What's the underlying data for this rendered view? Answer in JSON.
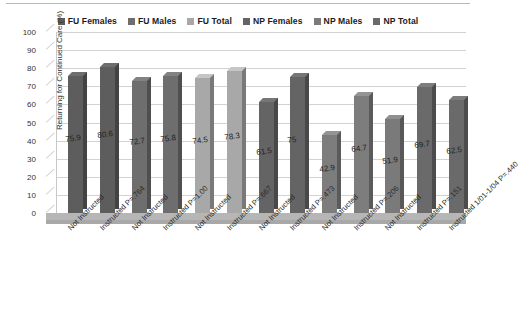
{
  "chart_data": {
    "type": "bar",
    "title": "",
    "xlabel": "",
    "ylabel": "Returning for Continued Care (%)",
    "ylim": [
      0,
      100
    ],
    "ytick_step": 10,
    "ytick_labels": [
      "100",
      "90",
      "80",
      "70",
      "60",
      "50",
      "40",
      "30",
      "20",
      "10",
      "0"
    ],
    "grid": true,
    "legend_position": "top-center",
    "three_d": true,
    "legend": [
      {
        "label": "FU Females",
        "color": "#5d5d5d"
      },
      {
        "label": "FU Males",
        "color": "#6e6e6e"
      },
      {
        "label": "FU Total",
        "color": "#a8a8a8"
      },
      {
        "label": "NP Females",
        "color": "#646464"
      },
      {
        "label": "NP Males",
        "color": "#7a7a7a"
      },
      {
        "label": "NP Total",
        "color": "#6a6a6a"
      }
    ],
    "categories": [
      "Not Instructed",
      "Instructed P=.764",
      "Not Instructed",
      "Instructed P=1.00",
      "Not Instructed",
      "Instructed P=.667",
      "Not Instructed",
      "Instructed P=.473",
      "Not Instructed",
      "Instructed P=.206",
      "Not Instructed",
      "Instructed P=.151",
      "Instructed 1/01-1/04 P=.440"
    ],
    "values": [
      75.9,
      80.6,
      72.7,
      75.8,
      74.5,
      78.3,
      61.5,
      75,
      42.9,
      64.7,
      51.9,
      69.7,
      62.5
    ],
    "value_labels": [
      "75.9",
      "80.6",
      "72.7",
      "75.8",
      "74.5",
      "78.3",
      "61.5",
      "75",
      "42.9",
      "64.7",
      "51.9",
      "69.7",
      "62.5"
    ],
    "bar_colors": [
      "#5d5d5d",
      "#5d5d5d",
      "#6e6e6e",
      "#6e6e6e",
      "#a8a8a8",
      "#a8a8a8",
      "#646464",
      "#646464",
      "#7d7d7d",
      "#7d7d7d",
      "#7a7a7a",
      "#6a6a6a",
      "#6a6a6a"
    ],
    "series_assignment": [
      "FU Females",
      "FU Females",
      "FU Males",
      "FU Males",
      "FU Total",
      "FU Total",
      "NP Females",
      "NP Females",
      "NP Males",
      "NP Males",
      "NP Total",
      "NP Total",
      "NP Total"
    ]
  }
}
